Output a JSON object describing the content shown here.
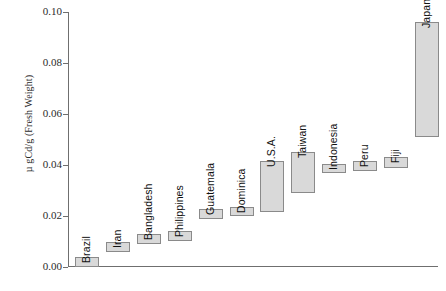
{
  "chart_data": {
    "type": "bar",
    "title": "",
    "subtitle": "",
    "xlabel": "",
    "ylabel": "µ gCd/g (Fresh Weight)",
    "ylim": [
      0.0,
      0.1
    ],
    "ytick_labels": [
      "0.10",
      "0.08",
      "0.06",
      "0.04",
      "0.02",
      "0.00"
    ],
    "ytick_values": [
      0.1,
      0.08,
      0.06,
      0.04,
      0.02,
      0.0
    ],
    "grid": false,
    "legend": "none",
    "note": "Floating range bars: each bar spans a low-to-high concentration range per country.",
    "categories": [
      "Brazil",
      "Iran",
      "Bangladesh",
      "Philippines",
      "Guatemala",
      "Dominica",
      "U.S.A.",
      "Taiwan",
      "Indonesia",
      "Peru",
      "Fiji",
      "Japan"
    ],
    "series": [
      {
        "name": "Cd concentration range",
        "low": [
          0.0,
          0.006,
          0.009,
          0.01,
          0.019,
          0.02,
          0.0215,
          0.029,
          0.037,
          0.0375,
          0.039,
          0.051
        ],
        "high": [
          0.0038,
          0.0098,
          0.013,
          0.014,
          0.0228,
          0.0235,
          0.0415,
          0.045,
          0.0405,
          0.0415,
          0.043,
          0.096
        ]
      }
    ],
    "bars": [
      {
        "label": "Brazil",
        "low": 0.0,
        "high": 0.0038
      },
      {
        "label": "Iran",
        "low": 0.006,
        "high": 0.0098
      },
      {
        "label": "Bangladesh",
        "low": 0.009,
        "high": 0.013
      },
      {
        "label": "Philippines",
        "low": 0.01,
        "high": 0.014
      },
      {
        "label": "Guatemala",
        "low": 0.019,
        "high": 0.0228
      },
      {
        "label": "Dominica",
        "low": 0.02,
        "high": 0.0235
      },
      {
        "label": "U.S.A.",
        "low": 0.0215,
        "high": 0.0415
      },
      {
        "label": "Taiwan",
        "low": 0.029,
        "high": 0.045
      },
      {
        "label": "Indonesia",
        "low": 0.037,
        "high": 0.0405
      },
      {
        "label": "Peru",
        "low": 0.0375,
        "high": 0.0415
      },
      {
        "label": "Fiji",
        "low": 0.039,
        "high": 0.043
      },
      {
        "label": "Japan",
        "low": 0.051,
        "high": 0.096
      }
    ],
    "colors": {
      "bar_fill": "#d9d9d9",
      "bar_border": "#8a8a8a",
      "axis": "#6f6f6f",
      "text": "#1a1a1a",
      "background": "#ffffff"
    }
  }
}
